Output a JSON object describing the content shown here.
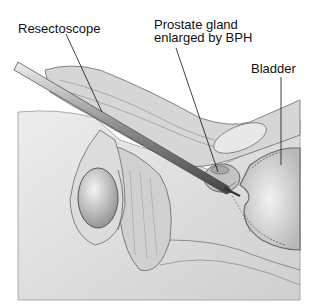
{
  "diagram": {
    "type": "anatomical-illustration",
    "labels": {
      "resectoscope": "Resectoscope",
      "prostate_line1": "Prostate gland",
      "prostate_line2": "enlarged by BPH",
      "bladder": "Bladder"
    },
    "colors": {
      "background": "#ffffff",
      "tissue_light": "#e4e4e4",
      "tissue_mid": "#c8c8c8",
      "tissue_dark": "#8a8a8a",
      "outline": "#555555",
      "instrument": "#7a7a7a",
      "leader_line": "#111111"
    }
  }
}
